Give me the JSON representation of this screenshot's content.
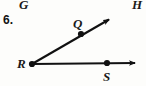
{
  "figure": {
    "problem_number": "6.",
    "background_color": "#fdfdfb",
    "ink_color": "#111111",
    "width": 146,
    "height": 86
  },
  "neighbor_labels": {
    "top_left": "G",
    "top_right": "H"
  },
  "points": [
    {
      "name": "Q",
      "label": "Q",
      "x": 81,
      "y": 34,
      "label_x": 73,
      "label_y": 17
    },
    {
      "name": "R",
      "label": "R",
      "x": 32,
      "y": 64,
      "label_x": 17,
      "label_y": 57
    },
    {
      "name": "S",
      "label": "S",
      "x": 107,
      "y": 63,
      "label_x": 103,
      "label_y": 70
    }
  ],
  "rays": [
    {
      "name": "ray-RQ",
      "from": "R",
      "through": "Q",
      "start_x": 32,
      "start_y": 64,
      "end_x": 112,
      "end_y": 17,
      "arrow_at_end": true
    },
    {
      "name": "ray-RS",
      "from": "R",
      "through": "S",
      "start_x": 32,
      "start_y": 64,
      "end_x": 141,
      "end_y": 63,
      "arrow_at_end": true
    }
  ]
}
